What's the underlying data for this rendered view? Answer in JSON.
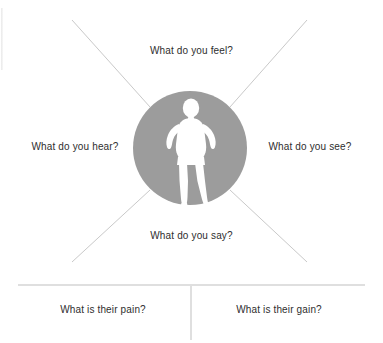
{
  "diagram": {
    "center": {
      "figure_icon": "person-silhouette-icon",
      "circle_color": "#9a9a9a",
      "figure_color": "#ffffff"
    },
    "quadrants": [
      {
        "id": "feel",
        "label": "What do you feel?",
        "position": "top"
      },
      {
        "id": "hear",
        "label": "What do you hear?",
        "position": "left"
      },
      {
        "id": "see",
        "label": "What do you see?",
        "position": "right"
      },
      {
        "id": "say",
        "label": "What do you say?",
        "position": "bottom"
      }
    ],
    "footer_sections": [
      {
        "id": "pain",
        "label": "What is their pain?",
        "position": "bottom-left"
      },
      {
        "id": "gain",
        "label": "What is their gain?",
        "position": "bottom-right"
      }
    ],
    "colors": {
      "line": "#c9c9c9",
      "divider": "#bfbfbf",
      "text": "#2e2e2e",
      "background": "#ffffff"
    }
  }
}
